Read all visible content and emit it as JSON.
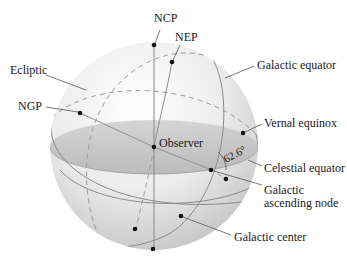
{
  "diagram": {
    "colors": {
      "sphere_light": "#f7f7f7",
      "sphere_dark": "#c9c9c9",
      "equator_plane": "#b9b9b9",
      "lines": "#8a8a8a",
      "points": "#111111",
      "text": "#1a1a1a"
    },
    "labels": {
      "ncp": "NCP",
      "nep": "NEP",
      "ecliptic": "Ecliptic",
      "galactic_equator": "Galactic equator",
      "ngp": "NGP",
      "vernal_equinox": "Vernal equinox",
      "observer": "Observer",
      "angle": "62.6°",
      "celestial_equator": "Celestial equator",
      "galactic_ascending_node_1": "Galactic",
      "galactic_ascending_node_2": "ascending node",
      "galactic_center": "Galactic center"
    },
    "points": [
      {
        "id": "ncp",
        "name": "North celestial pole"
      },
      {
        "id": "nep",
        "name": "North ecliptic pole"
      },
      {
        "id": "ngp",
        "name": "North galactic pole"
      },
      {
        "id": "observer",
        "name": "Observer"
      },
      {
        "id": "vernal-equinox",
        "name": "Vernal equinox"
      },
      {
        "id": "galactic-ascending-node",
        "name": "Galactic ascending node"
      },
      {
        "id": "galactic-center",
        "name": "Galactic center"
      },
      {
        "id": "south-ecliptic-pole",
        "name": "South ecliptic pole"
      },
      {
        "id": "south-galactic-pole",
        "name": "South galactic pole"
      },
      {
        "id": "south-celestial-pole",
        "name": "South celestial pole"
      }
    ],
    "inclination_angle_deg": 62.6
  }
}
